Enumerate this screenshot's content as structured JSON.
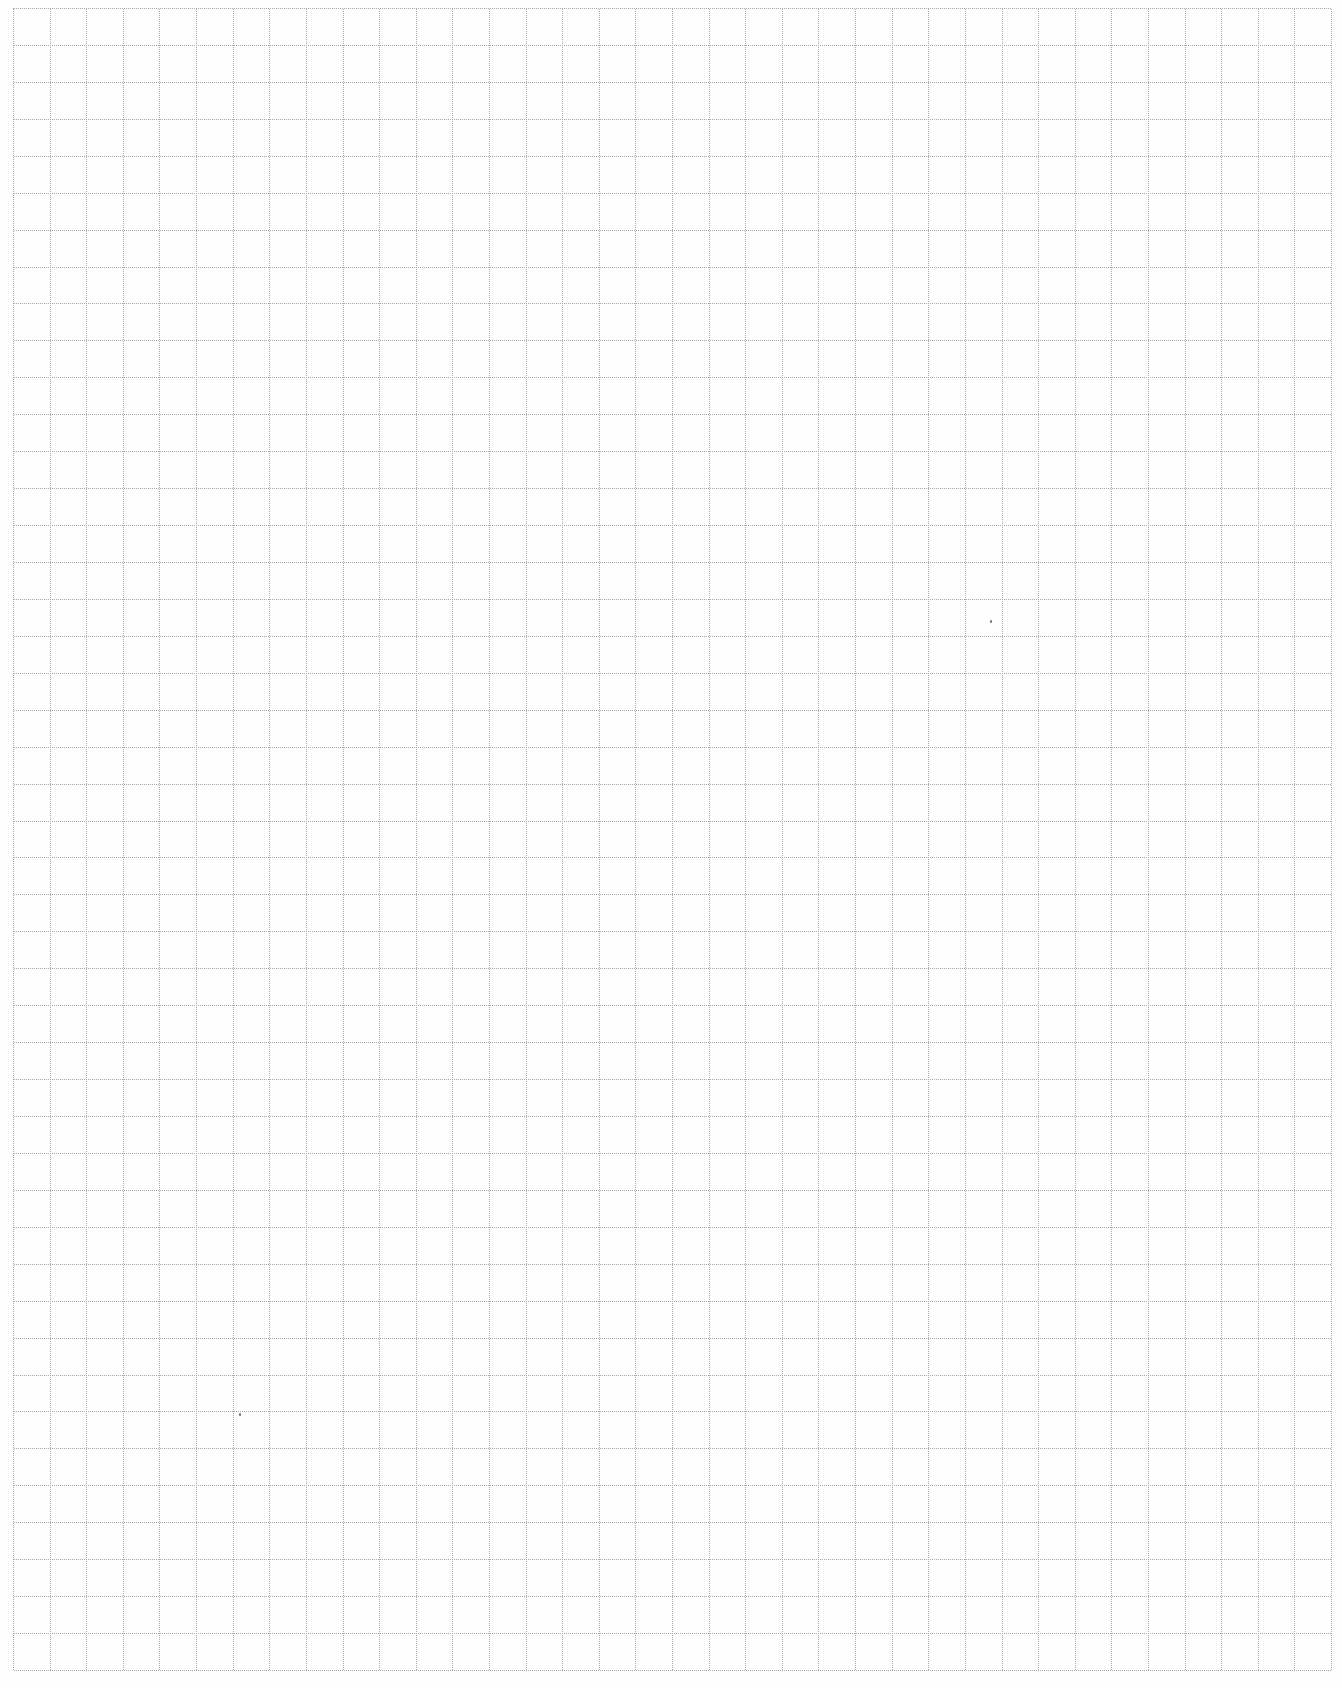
{
  "document": {
    "type": "graph-paper",
    "grid": {
      "columns": 36,
      "rows": 45,
      "line_style": "dotted",
      "line_color": "#a8a8a8",
      "background_color": "#ffffff"
    },
    "specks": [
      {
        "x": 990,
        "y": 620
      },
      {
        "x": 239,
        "y": 1413
      }
    ]
  }
}
